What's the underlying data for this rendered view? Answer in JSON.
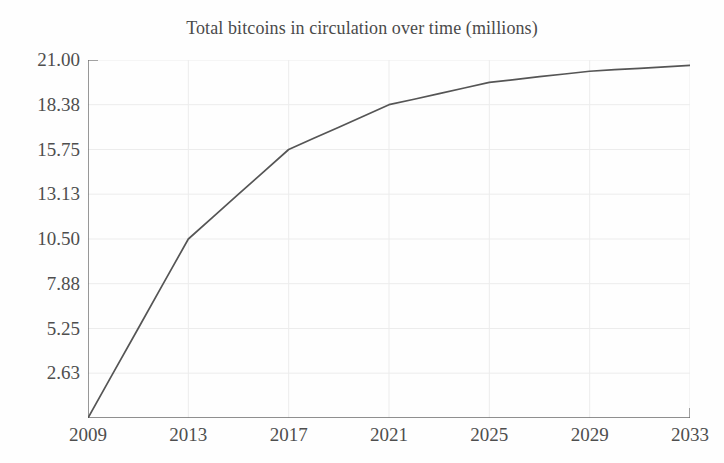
{
  "chart_data": {
    "type": "line",
    "title": "Total bitcoins in circulation over time (millions)",
    "xlabel": "",
    "ylabel": "",
    "xlim": [
      2009,
      2033
    ],
    "ylim": [
      0,
      21.0
    ],
    "grid": true,
    "legend": null,
    "line_color": "#555555",
    "grid_color": "#ececec",
    "axis_color": "#6a6a6a",
    "background_color": "#fefefe",
    "x_ticks": [
      2009,
      2013,
      2017,
      2021,
      2025,
      2029,
      2033
    ],
    "x_tick_labels": [
      "2009",
      "2013",
      "2017",
      "2021",
      "2025",
      "2029",
      "2033"
    ],
    "y_ticks": [
      2.63,
      5.25,
      7.88,
      10.5,
      13.13,
      15.75,
      18.38,
      21.0
    ],
    "y_tick_labels": [
      "2.63",
      "5.25",
      "7.88",
      "10.50",
      "13.13",
      "15.75",
      "18.38",
      "21.00"
    ],
    "series": [
      {
        "name": "Total bitcoins in circulation",
        "x": [
          2009,
          2010,
          2011,
          2012,
          2013,
          2014,
          2015,
          2016,
          2017,
          2018,
          2019,
          2020,
          2021,
          2022,
          2023,
          2024,
          2025,
          2026,
          2027,
          2028,
          2029,
          2030,
          2031,
          2032,
          2033
        ],
        "values": [
          0.0,
          2.63,
          5.25,
          7.88,
          10.5,
          11.81,
          13.13,
          14.44,
          15.75,
          16.41,
          17.06,
          17.72,
          18.38,
          18.7,
          19.03,
          19.36,
          19.69,
          19.85,
          20.02,
          20.18,
          20.34,
          20.43,
          20.51,
          20.6,
          20.68
        ]
      }
    ]
  }
}
